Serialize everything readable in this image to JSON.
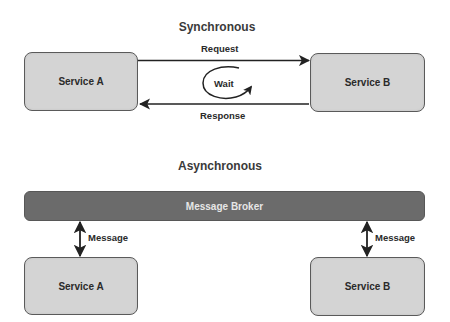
{
  "synchronous": {
    "title": "Synchronous",
    "service_a": {
      "label": "Service A"
    },
    "service_b": {
      "label": "Service B"
    },
    "request_label": "Request",
    "response_label": "Response",
    "wait_label": "Wait"
  },
  "asynchronous": {
    "title": "Asynchronous",
    "broker": {
      "label": "Message Broker"
    },
    "service_a": {
      "label": "Service A"
    },
    "service_b": {
      "label": "Service B"
    },
    "message_label_a": "Message",
    "message_label_b": "Message"
  },
  "colors": {
    "service_fill": "#d4d4d4",
    "service_border": "#5a5a5a",
    "broker_fill": "#6b6b6b",
    "broker_text": "#e6e6e6",
    "arrow": "#222222",
    "text": "#2a2a2a"
  }
}
